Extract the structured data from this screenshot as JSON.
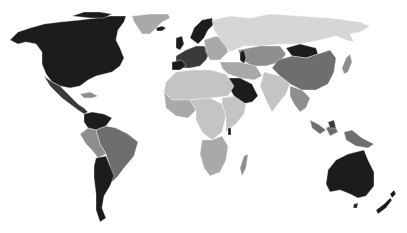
{
  "map": {
    "type": "choropleth",
    "projection": "equirectangular-like world",
    "legend": null,
    "title": null,
    "shades": {
      "darkest": "#1c1c1c",
      "dark": "#3a3a3a",
      "medium_dark": "#6e6e6e",
      "medium": "#8e8e8e",
      "medium_light": "#a9a9a9",
      "light": "#c4c4c4",
      "lightest": "#d6d6d6"
    },
    "regions": [
      {
        "name": "North America (Canada, USA)",
        "shade": "darkest"
      },
      {
        "name": "Alaska",
        "shade": "darkest"
      },
      {
        "name": "Mexico",
        "shade": "dark"
      },
      {
        "name": "Central America",
        "shade": "dark"
      },
      {
        "name": "Caribbean",
        "shade": "medium"
      },
      {
        "name": "Greenland",
        "shade": "medium_light"
      },
      {
        "name": "Iceland",
        "shade": "darkest"
      },
      {
        "name": "Colombia / Venezuela",
        "shade": "darkest"
      },
      {
        "name": "Brazil",
        "shade": "medium_dark"
      },
      {
        "name": "Peru / Bolivia",
        "shade": "medium"
      },
      {
        "name": "Argentina / Chile",
        "shade": "darkest"
      },
      {
        "name": "Scandinavia",
        "shade": "darkest"
      },
      {
        "name": "UK / Ireland",
        "shade": "darkest"
      },
      {
        "name": "Western Europe",
        "shade": "dark"
      },
      {
        "name": "Eastern Europe",
        "shade": "medium_light"
      },
      {
        "name": "Russia",
        "shade": "lightest"
      },
      {
        "name": "Central Asia",
        "shade": "medium"
      },
      {
        "name": "Caspian",
        "shade": "darkest"
      },
      {
        "name": "Middle East",
        "shade": "medium_light"
      },
      {
        "name": "Saudi Arabia",
        "shade": "darkest"
      },
      {
        "name": "North Africa",
        "shade": "light"
      },
      {
        "name": "West Africa",
        "shade": "medium_light"
      },
      {
        "name": "Central Africa",
        "shade": "light"
      },
      {
        "name": "East Africa",
        "shade": "light"
      },
      {
        "name": "Southern Africa",
        "shade": "medium_light"
      },
      {
        "name": "Madagascar",
        "shade": "medium"
      },
      {
        "name": "India",
        "shade": "light"
      },
      {
        "name": "Mongolia",
        "shade": "darkest"
      },
      {
        "name": "China",
        "shade": "medium_dark"
      },
      {
        "name": "Southeast Asia",
        "shade": "medium"
      },
      {
        "name": "Japan",
        "shade": "medium"
      },
      {
        "name": "Indonesia / PNG",
        "shade": "medium_dark"
      },
      {
        "name": "Australia",
        "shade": "darkest"
      },
      {
        "name": "New Zealand",
        "shade": "darkest"
      }
    ]
  }
}
